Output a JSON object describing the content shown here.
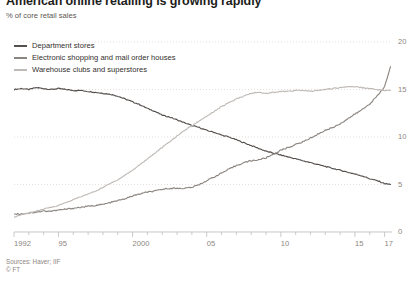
{
  "header": {
    "title": "American online retailing is growing rapidly",
    "subtitle": "% of core retail sales"
  },
  "footer": {
    "source": "Sources: Haver; IIF",
    "copyright": "© FT"
  },
  "legend": [
    {
      "label": "Department stores",
      "color": "#55504d"
    },
    {
      "label": "Electronic shopping and mail order houses",
      "color": "#8c8681"
    },
    {
      "label": "Warehouse clubs and superstores",
      "color": "#bfbab6"
    }
  ],
  "chart_data": {
    "type": "line",
    "title": "American online retailing is growing rapidly",
    "subtitle": "% of core retail sales",
    "xlabel": "",
    "ylabel": "% of core retail sales",
    "xlim": [
      1992,
      2017.5
    ],
    "ylim": [
      0,
      20
    ],
    "yticks": [
      0,
      5,
      10,
      15,
      20
    ],
    "ytick_labels": [
      "0",
      "5",
      "10",
      "15",
      "20"
    ],
    "xticks": [
      1992,
      1995,
      2000,
      2005,
      2010,
      2015,
      2017
    ],
    "xtick_labels": [
      "1992",
      "95",
      "2000",
      "05",
      "10",
      "15",
      "17"
    ],
    "grid": "horizontal-dotted",
    "legend_position": "top-left",
    "x": [
      1992,
      1992.5,
      1993,
      1993.5,
      1994,
      1994.5,
      1995,
      1995.5,
      1996,
      1996.5,
      1997,
      1997.5,
      1998,
      1998.5,
      1999,
      1999.5,
      2000,
      2000.5,
      2001,
      2001.5,
      2002,
      2002.5,
      2003,
      2003.5,
      2004,
      2004.5,
      2005,
      2005.5,
      2006,
      2006.5,
      2007,
      2007.5,
      2008,
      2008.5,
      2009,
      2009.5,
      2010,
      2010.5,
      2011,
      2011.5,
      2012,
      2012.5,
      2013,
      2013.5,
      2014,
      2014.5,
      2015,
      2015.5,
      2016,
      2016.5,
      2017,
      2017.4
    ],
    "series": [
      {
        "name": "Department stores",
        "color": "#55504d",
        "values": [
          15.0,
          15.1,
          15.0,
          15.2,
          15.1,
          15.0,
          15.1,
          15.0,
          14.9,
          14.9,
          14.8,
          14.7,
          14.6,
          14.5,
          14.3,
          14.0,
          13.7,
          13.4,
          13.0,
          12.7,
          12.3,
          12.1,
          11.8,
          11.5,
          11.2,
          11.0,
          10.7,
          10.5,
          10.2,
          10.0,
          9.7,
          9.4,
          9.1,
          8.8,
          8.5,
          8.3,
          8.1,
          7.9,
          7.7,
          7.5,
          7.3,
          7.1,
          6.9,
          6.7,
          6.5,
          6.3,
          6.1,
          5.9,
          5.6,
          5.4,
          5.1,
          5.0
        ]
      },
      {
        "name": "Electronic shopping and mail order houses",
        "color": "#8c8681",
        "values": [
          1.9,
          1.9,
          2.0,
          2.1,
          2.2,
          2.2,
          2.3,
          2.4,
          2.5,
          2.6,
          2.7,
          2.8,
          2.9,
          3.1,
          3.3,
          3.5,
          3.8,
          4.0,
          4.2,
          4.3,
          4.5,
          4.6,
          4.6,
          4.6,
          4.7,
          5.0,
          5.4,
          5.8,
          6.2,
          6.6,
          7.0,
          7.3,
          7.5,
          7.6,
          7.8,
          8.2,
          8.6,
          8.9,
          9.2,
          9.5,
          9.9,
          10.3,
          10.7,
          11.0,
          11.4,
          11.9,
          12.4,
          12.9,
          13.5,
          14.3,
          15.3,
          17.4
        ]
      },
      {
        "name": "Warehouse clubs and superstores",
        "color": "#bfbab6",
        "values": [
          1.6,
          1.8,
          2.0,
          2.2,
          2.4,
          2.6,
          2.8,
          3.1,
          3.4,
          3.7,
          4.0,
          4.3,
          4.7,
          5.1,
          5.5,
          6.0,
          6.5,
          7.1,
          7.7,
          8.3,
          8.9,
          9.5,
          10.1,
          10.7,
          11.2,
          11.7,
          12.2,
          12.7,
          13.2,
          13.6,
          14.0,
          14.3,
          14.6,
          14.7,
          14.6,
          14.7,
          14.8,
          14.8,
          14.9,
          14.9,
          14.8,
          14.9,
          15.0,
          15.1,
          15.2,
          15.3,
          15.3,
          15.2,
          15.1,
          15.0,
          14.9,
          14.9
        ]
      }
    ]
  }
}
